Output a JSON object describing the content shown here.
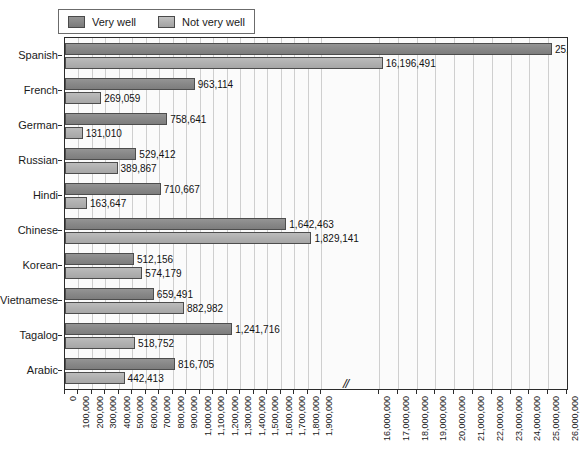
{
  "chart_data": {
    "type": "bar",
    "orientation": "horizontal",
    "title": "",
    "xlabel": "Estimates",
    "ylabel": "",
    "grid": true,
    "legend_position": "top-left",
    "axis_break": {
      "symbol": "//",
      "after": 1900000,
      "resumes_at": 16000000
    },
    "categories": [
      "Spanish",
      "French",
      "German",
      "Russian",
      "Hindi",
      "Chinese",
      "Korean",
      "Vietnamese",
      "Tagalog",
      "Arabic"
    ],
    "series": [
      {
        "name": "Very well",
        "color": "#8a8a8a",
        "values": [
          25196491,
          963114,
          758641,
          529412,
          710667,
          1642463,
          512156,
          659491,
          1241716,
          816705
        ],
        "labels": [
          "25,196,491",
          "963,114",
          "758,641",
          "529,412",
          "710,667",
          "1,642,463",
          "512,156",
          "659,491",
          "1,241,716",
          "816,705"
        ]
      },
      {
        "name": "Not very well",
        "color": "#b2b2b2",
        "values": [
          16196491,
          269059,
          131010,
          389867,
          163647,
          1829141,
          574179,
          882982,
          518752,
          442413
        ],
        "labels": [
          "16,196,491",
          "269,059",
          "131,010",
          "389,867",
          "163,647",
          "1,829,141",
          "574,179",
          "882,982",
          "518,752",
          "442,413"
        ]
      }
    ],
    "xticks": [
      {
        "value": 0,
        "label": "0"
      },
      {
        "value": 100000,
        "label": "100,000"
      },
      {
        "value": 200000,
        "label": "200,000"
      },
      {
        "value": 300000,
        "label": "300,000"
      },
      {
        "value": 400000,
        "label": "400,000"
      },
      {
        "value": 500000,
        "label": "500,000"
      },
      {
        "value": 600000,
        "label": "600,000"
      },
      {
        "value": 700000,
        "label": "700,000"
      },
      {
        "value": 800000,
        "label": "800,000"
      },
      {
        "value": 900000,
        "label": "900,000"
      },
      {
        "value": 1000000,
        "label": "1,000,000"
      },
      {
        "value": 1100000,
        "label": "1,100,000"
      },
      {
        "value": 1200000,
        "label": "1,200,000"
      },
      {
        "value": 1300000,
        "label": "1,300,000"
      },
      {
        "value": 1400000,
        "label": "1,400,000"
      },
      {
        "value": 1500000,
        "label": "1,500,000"
      },
      {
        "value": 1600000,
        "label": "1,600,000"
      },
      {
        "value": 1700000,
        "label": "1,700,000"
      },
      {
        "value": 1800000,
        "label": "1,800,000"
      },
      {
        "value": 1900000,
        "label": "1,900,000"
      },
      {
        "value": 16000000,
        "label": "16,000,000"
      },
      {
        "value": 17000000,
        "label": "17,000,000"
      },
      {
        "value": 18000000,
        "label": "18,000,000"
      },
      {
        "value": 19000000,
        "label": "19,000,000"
      },
      {
        "value": 20000000,
        "label": "20,000,000"
      },
      {
        "value": 21000000,
        "label": "21,000,000"
      },
      {
        "value": 22000000,
        "label": "22,000,000"
      },
      {
        "value": 23000000,
        "label": "23,000,000"
      },
      {
        "value": 24000000,
        "label": "24,000,000"
      },
      {
        "value": 25000000,
        "label": "25,000,000"
      },
      {
        "value": 26000000,
        "label": "26,000,000"
      }
    ]
  },
  "legend": {
    "items": [
      {
        "label": "Very well",
        "color": "#8a8a8a"
      },
      {
        "label": "Not very well",
        "color": "#b2b2b2"
      }
    ]
  },
  "axis": {
    "x_title": "Estimates",
    "break_symbol": "//"
  }
}
